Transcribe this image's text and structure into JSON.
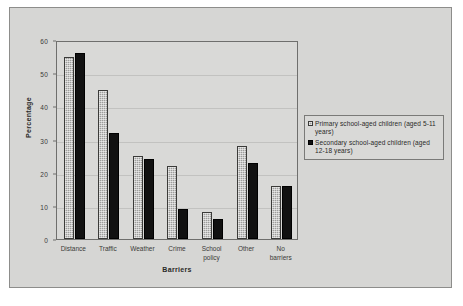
{
  "chart_data": {
    "type": "bar",
    "title": "",
    "xlabel": "Barriers",
    "ylabel": "Percentage",
    "ylim": [
      0,
      60
    ],
    "yticks": [
      0,
      10,
      20,
      30,
      40,
      50,
      60
    ],
    "grid": true,
    "legend_position": "right",
    "categories": [
      "Distance",
      "Traffic",
      "Weather",
      "Crime",
      "School policy",
      "Other",
      "No barriers"
    ],
    "category_lines": [
      [
        "Distance"
      ],
      [
        "Traffic"
      ],
      [
        "Weather"
      ],
      [
        "Crime"
      ],
      [
        "School",
        "policy"
      ],
      [
        "Other"
      ],
      [
        "No",
        "barriers"
      ]
    ],
    "series": [
      {
        "name": "Primary school-aged children (aged 5-11 years)",
        "key": "primary",
        "color": "#9d9d9b",
        "values": [
          55,
          45,
          25,
          22,
          8,
          28,
          16
        ]
      },
      {
        "name": "Secondary school-aged children (aged 12-18 years)",
        "key": "secondary",
        "color": "#111111",
        "values": [
          56,
          32,
          24,
          9,
          6,
          23,
          16
        ]
      }
    ]
  },
  "legend": {
    "entries": [
      "Primary school-aged children (aged 5-11 years)",
      "Secondary school-aged children (aged 12-18 years)"
    ]
  },
  "colors": {
    "figure_background": "#d6d6d4",
    "plot_background": "#d9d9d7",
    "axis": "#6f6f6d",
    "gridline": "#c2c2c0",
    "text": "#2a2a28"
  }
}
